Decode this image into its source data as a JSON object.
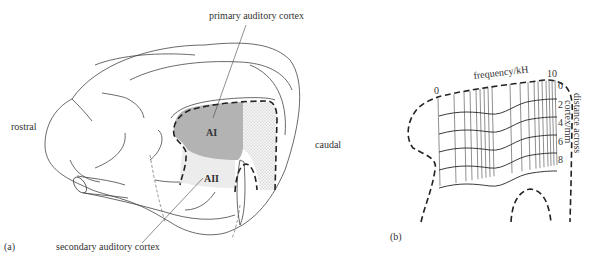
{
  "panel_a": {
    "label": "(a)",
    "direction_left": "rostral",
    "direction_right": "caudal",
    "callout_primary": "primary auditory cortex",
    "callout_secondary": "secondary auditory cortex",
    "region_primary": "AI",
    "region_secondary": "AII",
    "colors": {
      "primary_fill": "#b3b3b3",
      "secondary_fill": "#ececec",
      "stipple_fill": "#e2e2e2"
    }
  },
  "panel_b": {
    "label": "(b)",
    "x_axis_title": "frequency/kH",
    "x_axis_min_label": "0",
    "x_axis_max_label": "10",
    "y_axis_title_line1": "distance across",
    "y_axis_title_line2": "cortex/mm",
    "y_ticks": [
      "0",
      "2",
      "4",
      "6",
      "8"
    ]
  }
}
